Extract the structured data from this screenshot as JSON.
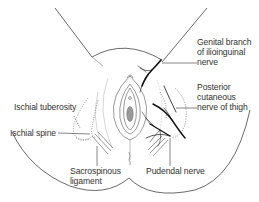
{
  "diagram": {
    "type": "anatomical-illustration",
    "colors": {
      "outline": "#444444",
      "nerve": "#111111",
      "dotted": "#666666",
      "light_contour": "#bbbbbb",
      "label_text": "#333333",
      "background": "#ffffff"
    },
    "labels": {
      "genital_branch": {
        "lines": [
          "Genital branch",
          "of ilioinguinal",
          "nerve"
        ]
      },
      "posterior_cutaneous": {
        "lines": [
          "Posterior",
          "cutaneous",
          "nerve of thigh"
        ]
      },
      "ischial_tuberosity": {
        "lines": [
          "Ischial tuberosity"
        ]
      },
      "ischial_spine": {
        "lines": [
          "Ischial spine"
        ]
      },
      "sacrospinous": {
        "lines": [
          "Sacrospinous",
          "ligament"
        ]
      },
      "pudendal": {
        "lines": [
          "Pudendal nerve"
        ]
      }
    }
  }
}
